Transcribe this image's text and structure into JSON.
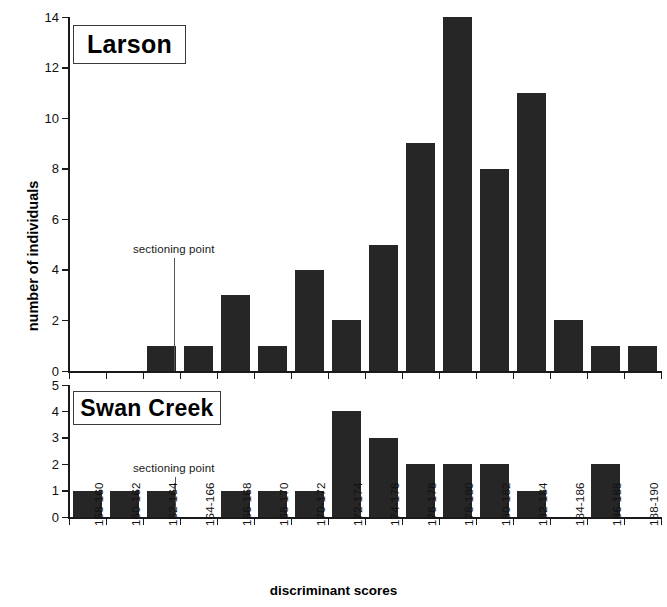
{
  "figure": {
    "width": 667,
    "height": 607,
    "background": "#ffffff",
    "bar_color": "#262626",
    "axis_color": "#1a1a1a"
  },
  "axis_titles": {
    "y": "number of individuals",
    "x": "discriminant scores"
  },
  "panels": [
    {
      "key": "larson",
      "title": "Larson",
      "annotation": "sectioning point",
      "y_ticks": [
        "0",
        "2",
        "4",
        "6",
        "8",
        "10",
        "12",
        "14"
      ],
      "y_max": 14
    },
    {
      "key": "swan_creek",
      "title": "Swan Creek",
      "annotation": "sectioning point",
      "y_ticks": [
        "0",
        "1",
        "2",
        "3",
        "4",
        "5"
      ],
      "y_max": 5
    }
  ],
  "categories": [
    "158-160",
    "160-162",
    "162-164",
    "164-166",
    "166-168",
    "168-170",
    "170-172",
    "172-174",
    "174-176",
    "176-178",
    "178-180",
    "180-182",
    "182-184",
    "184-186",
    "186-188",
    "188-190"
  ],
  "chart_data": {
    "type": "bar",
    "xlabel": "discriminant scores",
    "ylabel": "number of individuals",
    "grid": false,
    "legend": "none",
    "layout": "two stacked panels sharing the x axis",
    "categories": [
      "158-160",
      "160-162",
      "162-164",
      "164-166",
      "166-168",
      "168-170",
      "170-172",
      "172-174",
      "174-176",
      "176-178",
      "178-180",
      "180-182",
      "182-184",
      "184-186",
      "186-188",
      "188-190"
    ],
    "series": [
      {
        "name": "Larson",
        "panel": "top",
        "ylim": [
          0,
          14
        ],
        "ytick_step": 2,
        "annotation": {
          "text": "sectioning point",
          "at_category_boundary": "164-166 left edge"
        },
        "values": [
          0,
          0,
          1,
          1,
          3,
          1,
          4,
          2,
          5,
          9,
          14,
          8,
          11,
          2,
          1,
          1
        ]
      },
      {
        "name": "Swan Creek",
        "panel": "bottom",
        "ylim": [
          0,
          5
        ],
        "ytick_step": 1,
        "annotation": {
          "text": "sectioning point",
          "at_category_boundary": "164-166 right edge"
        },
        "values": [
          1,
          1,
          1,
          0,
          1,
          1,
          1,
          4,
          3,
          2,
          2,
          2,
          1,
          0,
          2,
          0
        ]
      }
    ]
  }
}
